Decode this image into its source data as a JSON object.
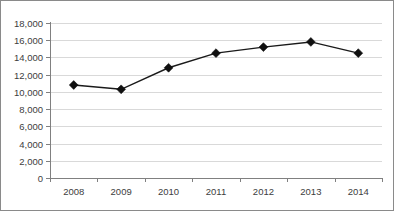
{
  "chart_data": {
    "type": "line",
    "title": "",
    "subtitle": "",
    "xlabel": "",
    "ylabel": "",
    "categories": [
      "2008",
      "2009",
      "2010",
      "2011",
      "2012",
      "2013",
      "2014"
    ],
    "values": [
      10800,
      10300,
      12800,
      14500,
      15200,
      15800,
      14500
    ],
    "series": [
      {
        "name": "",
        "values": [
          10800,
          10300,
          12800,
          14500,
          15200,
          15800,
          14500
        ]
      }
    ],
    "ylim": [
      0,
      18000
    ],
    "y_ticks": [
      0,
      2000,
      4000,
      6000,
      8000,
      10000,
      12000,
      14000,
      16000,
      18000
    ],
    "y_tick_labels": [
      "0",
      "2,000",
      "4,000",
      "6,000",
      "8,000",
      "10,000",
      "12,000",
      "14,000",
      "16,000",
      "18,000"
    ],
    "x_tick_labels": [
      "2008",
      "2009",
      "2010",
      "2011",
      "2012",
      "2013",
      "2014"
    ],
    "grid": "horizontal",
    "legend": "none",
    "marker": "diamond",
    "colors": {
      "line": "#1a1a1a",
      "marker": "#101010",
      "grid": "#d9d9d9",
      "axis": "#808080",
      "border": "#8a8a8a",
      "background": "#ffffff",
      "tick_text": "#3d3d3d"
    }
  }
}
